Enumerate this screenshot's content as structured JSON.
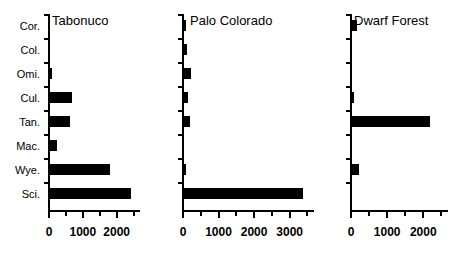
{
  "chart_data": [
    {
      "type": "bar",
      "orientation": "horizontal",
      "title": "Tabonuco",
      "categories": [
        "Cor.",
        "Col.",
        "Omi.",
        "Cul.",
        "Tan.",
        "Mac.",
        "Wye.",
        "Sci."
      ],
      "values": [
        0,
        0,
        60,
        650,
        600,
        210,
        1780,
        2400
      ],
      "xlabel": "",
      "ylabel": "",
      "xlim": [
        0,
        2600
      ],
      "xticks": [
        0,
        1000,
        2000
      ],
      "xticklabels": [
        "0",
        "1000",
        "2000"
      ],
      "minor_tick_step": 500,
      "grid": false,
      "legend": false,
      "bar_color": "#000000"
    },
    {
      "type": "bar",
      "orientation": "horizontal",
      "title": "Palo Colorado",
      "categories": [
        "Cor.",
        "Col.",
        "Omi.",
        "Cul.",
        "Tan.",
        "Mac.",
        "Wye.",
        "Sci."
      ],
      "values": [
        40,
        90,
        200,
        120,
        180,
        0,
        60,
        3350
      ],
      "xlabel": "",
      "ylabel": "",
      "xlim": [
        0,
        3600
      ],
      "xticks": [
        0,
        1000,
        2000,
        3000
      ],
      "xticklabels": [
        "0",
        "1000",
        "2000",
        "3000"
      ],
      "minor_tick_step": 500,
      "grid": false,
      "legend": false,
      "bar_color": "#000000"
    },
    {
      "type": "bar",
      "orientation": "horizontal",
      "title": "Dwarf Forest",
      "categories": [
        "Cor.",
        "Col.",
        "Omi.",
        "Cul.",
        "Tan.",
        "Mac.",
        "Wye.",
        "Sci."
      ],
      "values": [
        150,
        0,
        0,
        30,
        2150,
        0,
        180,
        0
      ],
      "xlabel": "",
      "ylabel": "",
      "xlim": [
        0,
        2600
      ],
      "xticks": [
        0,
        1000,
        2000
      ],
      "xticklabels": [
        "0",
        "1000",
        "2000"
      ],
      "minor_tick_step": 500,
      "grid": false,
      "legend": false,
      "bar_color": "#000000"
    }
  ],
  "figure": {
    "background_color": "#ffffff",
    "axis_color": "#000000",
    "panel_count": 3
  }
}
